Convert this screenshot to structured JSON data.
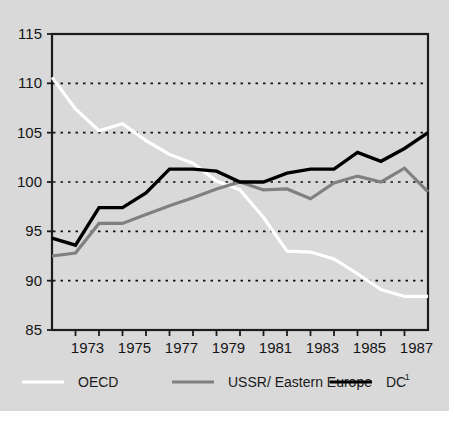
{
  "figure": {
    "background_color": "#d9d9d9",
    "plot_background_color": "#d9d9d9",
    "frame_color": "#1c1c1c"
  },
  "legend": {
    "position": "bottom",
    "entries": [
      {
        "label": "OECD",
        "color": "#ffffff",
        "superscript": ""
      },
      {
        "label": "USSR/ Eastern Europe",
        "color": "#808080",
        "superscript": ""
      },
      {
        "label": "DC",
        "color": "#000000",
        "superscript": "1"
      }
    ]
  },
  "axes": {
    "y_ticks": [
      "115",
      "110",
      "105",
      "100",
      "95",
      "90",
      "85"
    ],
    "x_ticks": [
      "1973",
      "1975",
      "1977",
      "1979",
      "1981",
      "1983",
      "1985",
      "1987"
    ]
  },
  "chart_data": {
    "type": "line",
    "title": "",
    "subtitle": "",
    "xlabel": "",
    "ylabel": "",
    "xlim": [
      1972,
      1988
    ],
    "ylim": [
      85,
      115
    ],
    "yticks": [
      85,
      90,
      95,
      100,
      105,
      110,
      115
    ],
    "ytick_labels": [
      "85",
      "90",
      "95",
      "100",
      "105",
      "110",
      "115"
    ],
    "xticks": [
      1972,
      1973,
      1974,
      1975,
      1976,
      1977,
      1978,
      1979,
      1980,
      1981,
      1982,
      1983,
      1984,
      1985,
      1986,
      1987,
      1988
    ],
    "xtick_labels": [
      "",
      "1973",
      "",
      "1975",
      "",
      "1977",
      "",
      "1979",
      "",
      "1981",
      "",
      "1983",
      "",
      "1985",
      "",
      "1987",
      ""
    ],
    "grid": true,
    "grid_values": [
      90,
      95,
      100,
      105,
      110
    ],
    "legend_position": "bottom",
    "x": [
      1972,
      1973,
      1974,
      1975,
      1976,
      1977,
      1978,
      1979,
      1980,
      1981,
      1982,
      1983,
      1984,
      1985,
      1986,
      1987,
      1988
    ],
    "series": [
      {
        "name": "OECD",
        "color": "#ffffff",
        "values": [
          110.6,
          107.4,
          105.2,
          105.9,
          104.2,
          102.8,
          101.9,
          100.1,
          99.2,
          96.4,
          93.0,
          92.9,
          92.2,
          90.7,
          89.1,
          88.4,
          88.4
        ]
      },
      {
        "name": "USSR/ Eastern Europe",
        "color": "#808080",
        "values": [
          92.5,
          92.8,
          95.8,
          95.8,
          96.7,
          97.6,
          98.4,
          99.3,
          100.0,
          99.2,
          99.3,
          98.3,
          99.9,
          100.6,
          100.0,
          101.4,
          99.0
        ]
      },
      {
        "name": "DC",
        "color": "#000000",
        "values": [
          94.3,
          93.6,
          97.4,
          97.4,
          98.9,
          101.3,
          101.3,
          101.1,
          100.0,
          100.0,
          100.9,
          101.3,
          101.3,
          103.0,
          102.1,
          103.4,
          105.0
        ]
      }
    ]
  }
}
